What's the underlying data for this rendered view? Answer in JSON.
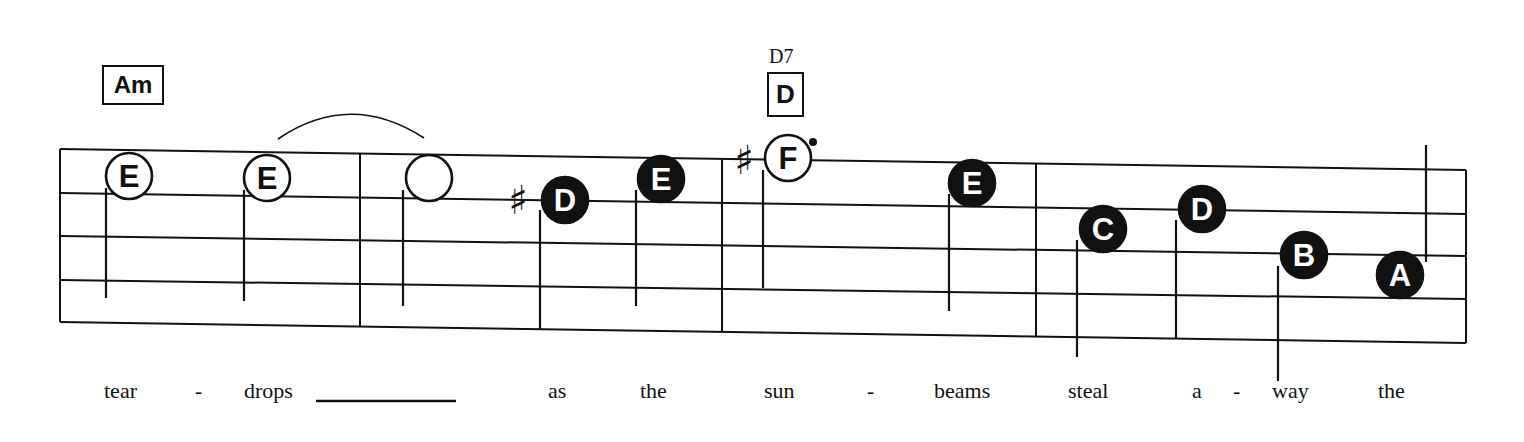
{
  "chords": [
    {
      "label": "Am",
      "x": 102,
      "y": 65,
      "w": 62,
      "h": 40,
      "font": 24
    },
    {
      "label": "D",
      "x": 767,
      "y": 72,
      "w": 37,
      "h": 45,
      "font": 26,
      "alt": "D7",
      "alt_x": 769,
      "alt_y": 45
    }
  ],
  "staff": {
    "left": 60,
    "right": 1466,
    "lines_left_y": [
      149,
      193,
      236,
      280,
      322
    ],
    "lines_right_y": [
      170,
      214,
      256,
      299,
      343
    ],
    "barlines_x": [
      360,
      722,
      1036
    ]
  },
  "notes": [
    {
      "letter": "E",
      "cx": 129,
      "cy": 176,
      "filled": false,
      "stem_x": 106,
      "stem_top": 188,
      "stem_bottom": 298
    },
    {
      "letter": "E",
      "cx": 267,
      "cy": 178,
      "filled": false,
      "stem_x": 244,
      "stem_top": 190,
      "stem_bottom": 301
    },
    {
      "letter": "",
      "cx": 429,
      "cy": 178,
      "filled": false,
      "stem_x": 403,
      "stem_top": 190,
      "stem_bottom": 306
    },
    {
      "letter": "D",
      "cx": 565,
      "cy": 200,
      "filled": true,
      "stem_x": 540,
      "stem_top": 210,
      "stem_bottom": 330,
      "sharp": true,
      "sharp_x": 518,
      "sharp_y": 200
    },
    {
      "letter": "E",
      "cx": 661,
      "cy": 179,
      "filled": true,
      "stem_x": 636,
      "stem_top": 190,
      "stem_bottom": 306
    },
    {
      "letter": "F",
      "cx": 788,
      "cy": 158,
      "filled": false,
      "stem_x": 763,
      "stem_top": 170,
      "stem_bottom": 288,
      "sharp": true,
      "sharp_x": 744,
      "sharp_y": 160,
      "dot_x": 813,
      "dot_y": 142
    },
    {
      "letter": "E",
      "cx": 972,
      "cy": 183,
      "filled": true,
      "stem_x": 949,
      "stem_top": 194,
      "stem_bottom": 311
    },
    {
      "letter": "C",
      "cx": 1103,
      "cy": 229,
      "filled": true,
      "stem_x": 1077,
      "stem_top": 240,
      "stem_bottom": 357
    },
    {
      "letter": "D",
      "cx": 1202,
      "cy": 209,
      "filled": true,
      "stem_x": 1176,
      "stem_top": 220,
      "stem_bottom": 338
    },
    {
      "letter": "B",
      "cx": 1304,
      "cy": 255,
      "filled": true,
      "stem_x": 1278,
      "stem_top": 266,
      "stem_bottom": 381
    },
    {
      "letter": "A",
      "cx": 1400,
      "cy": 275,
      "filled": true,
      "stem_x": 1426,
      "stem_top": 145,
      "stem_bottom": 262,
      "stem_up": true
    }
  ],
  "tie": {
    "x1": 278,
    "y1": 139,
    "cx": 350,
    "cy": 90,
    "x2": 424,
    "y2": 138
  },
  "lyrics": [
    {
      "text": "tear",
      "x": 104
    },
    {
      "text": "-",
      "x": 195
    },
    {
      "text": "drops",
      "x": 244
    },
    {
      "text": "as",
      "x": 548
    },
    {
      "text": "the",
      "x": 640
    },
    {
      "text": "sun",
      "x": 764
    },
    {
      "text": "-",
      "x": 867
    },
    {
      "text": "beams",
      "x": 934
    },
    {
      "text": "steal",
      "x": 1068
    },
    {
      "text": "a",
      "x": 1192
    },
    {
      "text": "-",
      "x": 1233
    },
    {
      "text": "way",
      "x": 1272
    },
    {
      "text": "the",
      "x": 1378
    }
  ],
  "extender": {
    "x1": 316,
    "x2": 456,
    "y": 401
  }
}
